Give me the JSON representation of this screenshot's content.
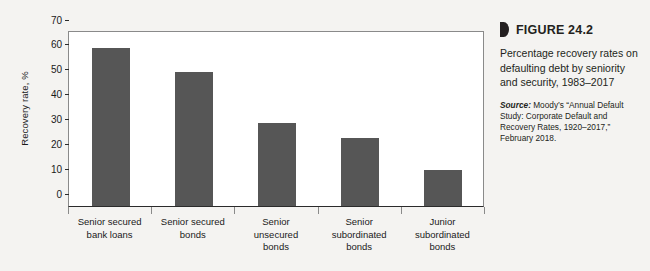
{
  "figure": {
    "marker_icon": "triangle-marker-icon",
    "number_label": "FIGURE 24.2",
    "caption": "Percentage recovery rates on defaulting debt by seniority and security, 1983–2017",
    "source_label": "Source:",
    "source_text": " Moody’s “Annual Default Study: Corporate Default and Recovery Rates, 1920–2017,” February 2018."
  },
  "colors": {
    "bar": "#565656",
    "axis": "#2b2b2b",
    "frame": "#8a8a8a",
    "page_background": "#f4f3f1",
    "plot_background": "#ffffff"
  },
  "chart_data": {
    "type": "bar",
    "title": "Percentage recovery rates on defaulting debt by seniority and security, 1983–2017",
    "xlabel": "",
    "ylabel": "Recovery rate, %",
    "ylim": [
      0,
      70
    ],
    "yticks": [
      0,
      10,
      20,
      30,
      40,
      50,
      60,
      70
    ],
    "ytick_labels": [
      "0",
      "10",
      "20",
      "30",
      "40",
      "50",
      "60",
      "70"
    ],
    "grid": false,
    "legend": false,
    "categories": [
      "Senior secured bank loans",
      "Senior secured bonds",
      "Senior unsecured bonds",
      "Senior subordinated bonds",
      "Junior subordinated bonds"
    ],
    "category_lines": [
      [
        "Senior secured",
        "bank loans"
      ],
      [
        "Senior secured",
        "bonds"
      ],
      [
        "Senior",
        "unsecured",
        "bonds"
      ],
      [
        "Senior",
        "subordinated",
        "bonds"
      ],
      [
        "Junior",
        "subordinated",
        "bonds"
      ]
    ],
    "values": [
      63.5,
      54.0,
      33.5,
      27.5,
      14.5
    ]
  }
}
